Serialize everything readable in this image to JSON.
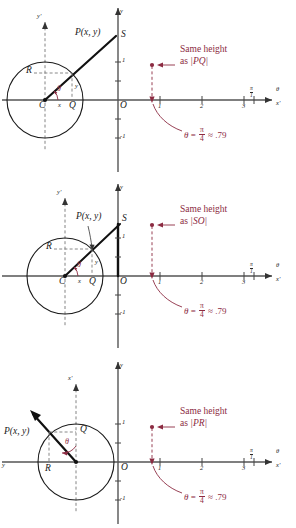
{
  "figure": {
    "colors": {
      "ink": "#1a1a1a",
      "axis": "#555555",
      "accent_red": "#8c2b42",
      "dash": "#7a7a7a"
    },
    "panels": [
      {
        "id": "panel-1",
        "circle": {
          "center_label": "C",
          "radius_label": "R"
        },
        "points": [
          {
            "name": "P",
            "label": "P(x, y)"
          },
          {
            "name": "S",
            "label": "S"
          },
          {
            "name": "Q",
            "label": "Q"
          },
          {
            "name": "O",
            "label": "O"
          },
          {
            "name": "C",
            "label": "C"
          },
          {
            "name": "R",
            "label": "R"
          }
        ],
        "segment_labels": {
          "x": "x",
          "y": "y",
          "angle": "θ"
        },
        "axes": {
          "vertical_prime": "y'",
          "vertical": "y",
          "horizontal_prime": "x'",
          "horizontal": "θ"
        },
        "y_ticks": [
          "1",
          "-1"
        ],
        "x_ticks": [
          "1",
          "2",
          "3"
        ],
        "pi_tick": {
          "num": "π",
          "den": "1"
        },
        "note": {
          "line1": "Same height",
          "line2_prefix": "as",
          "line2_value": "|PQ|"
        },
        "equation": {
          "theta": "θ",
          "equals": "=",
          "num": "π",
          "den": "4",
          "approx": "≈",
          "value": ".79"
        }
      },
      {
        "id": "panel-2",
        "circle": {
          "center_label": "C",
          "radius_label": "R"
        },
        "points": [
          {
            "name": "P",
            "label": "P(x, y)"
          },
          {
            "name": "S",
            "label": "S"
          },
          {
            "name": "Q",
            "label": "Q"
          },
          {
            "name": "O",
            "label": "O"
          },
          {
            "name": "C",
            "label": "C"
          },
          {
            "name": "R",
            "label": "R"
          }
        ],
        "segment_labels": {
          "x": "x",
          "y": "y",
          "angle": "θ"
        },
        "axes": {
          "vertical_prime": "y'",
          "vertical": "y",
          "horizontal_prime": "x'",
          "horizontal": "θ"
        },
        "y_ticks": [
          "1",
          "-1"
        ],
        "x_ticks": [
          "1",
          "2",
          "3"
        ],
        "pi_tick": {
          "num": "π",
          "den": "1"
        },
        "note": {
          "line1": "Same height",
          "line2_prefix": "as",
          "line2_value": "|SO|"
        },
        "equation": {
          "theta": "θ",
          "equals": "=",
          "num": "π",
          "den": "4",
          "approx": "≈",
          "value": ".79"
        }
      },
      {
        "id": "panel-3",
        "circle": {
          "center_label": "",
          "radius_label": "R"
        },
        "points": [
          {
            "name": "P",
            "label": "P(x, y)"
          },
          {
            "name": "Q",
            "label": "Q"
          },
          {
            "name": "R",
            "label": "R"
          },
          {
            "name": "O",
            "label": "O"
          }
        ],
        "segment_labels": {
          "angle": "θ"
        },
        "axes": {
          "vertical_prime": "x'",
          "vertical": "y",
          "horizontal_prime": "x'",
          "horizontal": "θ",
          "left": "y"
        },
        "y_ticks": [
          "1",
          "-1"
        ],
        "x_ticks": [
          "1",
          "2",
          "3"
        ],
        "pi_tick": {
          "num": "π",
          "den": "1"
        },
        "note": {
          "line1": "Same height",
          "line2_prefix": "as",
          "line2_value": "|PR|"
        },
        "equation": {
          "theta": "θ",
          "equals": "=",
          "num": "π",
          "den": "4",
          "approx": "≈",
          "value": ".79"
        }
      }
    ]
  }
}
